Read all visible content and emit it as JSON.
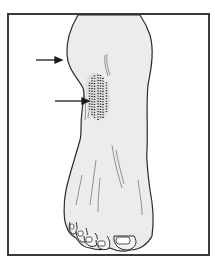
{
  "figure": {
    "alt_text": "Line drawing of a foot and lower leg with a stippled patch on the inner ankle, indicated by two arrows",
    "annotations": [
      {
        "type": "arrow",
        "points_to": "ankle swelling"
      },
      {
        "type": "arrow",
        "points_to": "stippled lesion"
      }
    ],
    "colors": {
      "skin": "#ececec",
      "outline": "#2a2a2a",
      "frame": "#3a3a3a",
      "background": "#ffffff"
    }
  }
}
